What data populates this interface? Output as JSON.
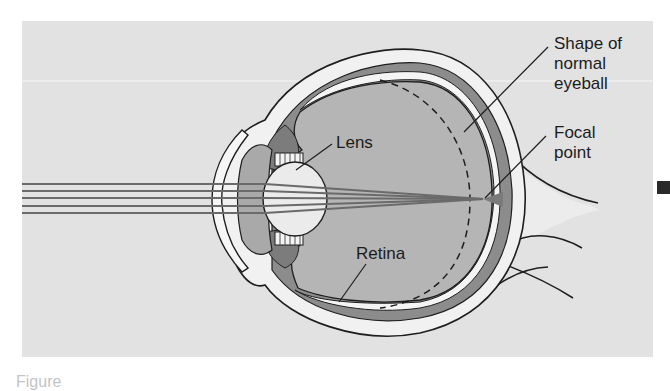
{
  "figure": {
    "type": "eye-anatomy-diagram",
    "colors": {
      "background_panel": "#e2e2e2",
      "sclera": "#f1f1f1",
      "choroid": "#8c8c8c",
      "vitreous": "#b5b5b5",
      "lens": "#ebebeb",
      "rays": "#6a6a6a",
      "outline": "#1e1e1e"
    }
  },
  "labels": {
    "shape_of_normal_eyeball": [
      "Shape of",
      "normal",
      "eyeball"
    ],
    "focal_point": [
      "Focal",
      "point"
    ],
    "lens": "Lens",
    "retina": "Retina"
  },
  "rays": {
    "count": 5,
    "y_positions": [
      184,
      191,
      198,
      206,
      213
    ],
    "focal_point": [
      483,
      199
    ]
  },
  "caption": {
    "text": "Figure"
  }
}
